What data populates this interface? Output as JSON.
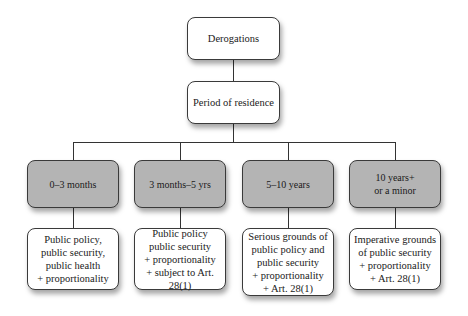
{
  "diagram": {
    "root": {
      "label": "Derogations"
    },
    "level1": {
      "label": "Period of residence"
    },
    "categories": [
      {
        "period": "0–3 months",
        "grounds": "Public policy,\npublic security,\npublic health\n+ proportionality"
      },
      {
        "period": "3 months–5 yrs",
        "grounds": "Public policy\npublic security\n+ proportionality\n+ subject to Art. 28(1)"
      },
      {
        "period": "5–10 years",
        "grounds": "Serious grounds of\npublic policy and\npublic security\n+ proportionality\n+ Art. 28(1)"
      },
      {
        "period": "10 years+\nor a minor",
        "grounds": "Imperative grounds\nof public security\n+ proportionality\n+ Art. 28(1)"
      }
    ],
    "colors": {
      "period_box_fill": "#b4b4b4",
      "grounds_box_fill": "#ffffff",
      "border": "#3a3a3a"
    }
  }
}
